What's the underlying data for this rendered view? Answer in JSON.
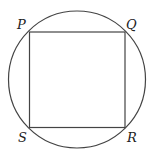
{
  "diagram": {
    "shapes": [
      "circle",
      "square"
    ],
    "vertices": {
      "top_left": "P",
      "top_right": "Q",
      "bottom_right": "R",
      "bottom_left": "S"
    },
    "colors": {
      "stroke": "#444444",
      "background": "#ffffff"
    }
  }
}
